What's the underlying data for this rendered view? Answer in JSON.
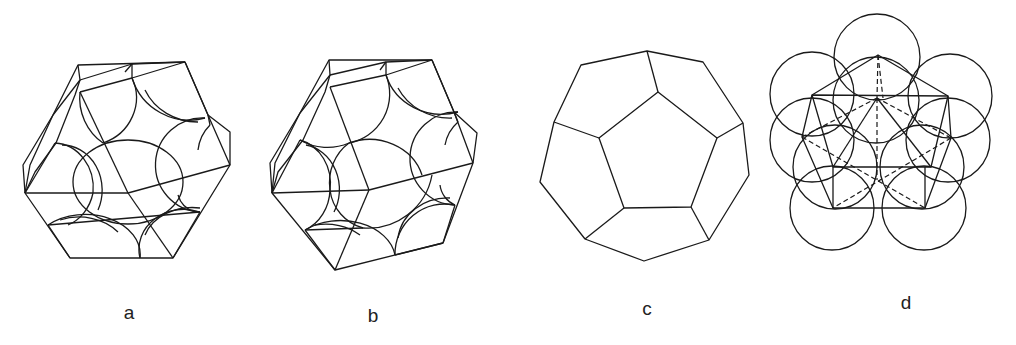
{
  "figure": {
    "panels": [
      {
        "id": "a",
        "label": "a",
        "description": "Truncated octahedron with inscribed packed spheres (view 1)"
      },
      {
        "id": "b",
        "label": "b",
        "description": "Truncated octahedron with inscribed packed spheres (view 2, rotated)"
      },
      {
        "id": "c",
        "label": "c",
        "description": "Pentagonal dodecahedron"
      },
      {
        "id": "d",
        "label": "d",
        "description": "Cluster of spheres around a polyhedron with dashed hidden edges"
      }
    ]
  },
  "colors": {
    "line": "#1a1a1a",
    "background": "#ffffff"
  }
}
